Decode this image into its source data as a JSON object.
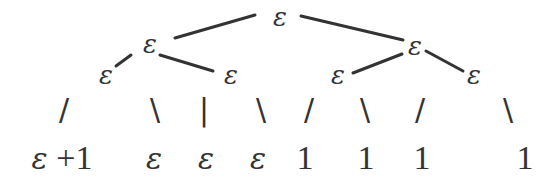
{
  "diagram": {
    "type": "tree",
    "nodes": {
      "root": {
        "label": "ε",
        "x": 280,
        "y": 17
      },
      "l": {
        "label": "ε",
        "x": 150,
        "y": 44
      },
      "r": {
        "label": "ε",
        "x": 415,
        "y": 46
      },
      "ll": {
        "label": "ε",
        "x": 108,
        "y": 74
      },
      "lr": {
        "label": "ε",
        "x": 231,
        "y": 75
      },
      "rl": {
        "label": "ε",
        "x": 338,
        "y": 75
      },
      "rr": {
        "label": "ε",
        "x": 474,
        "y": 75
      }
    },
    "connectors": [
      {
        "glyph": "/",
        "x": 64,
        "y": 110
      },
      {
        "glyph": "\\",
        "x": 155,
        "y": 110
      },
      {
        "glyph": "|",
        "x": 204,
        "y": 110
      },
      {
        "glyph": "\\",
        "x": 261,
        "y": 110
      },
      {
        "glyph": "/",
        "x": 309,
        "y": 110
      },
      {
        "glyph": "\\",
        "x": 365,
        "y": 110
      },
      {
        "glyph": "/",
        "x": 420,
        "y": 110
      },
      {
        "glyph": "\\",
        "x": 508,
        "y": 110
      }
    ],
    "leaves": [
      {
        "eps": "ε",
        "text": " +1",
        "x": 62,
        "y": 158
      },
      {
        "eps": "ε",
        "text": "",
        "x": 154,
        "y": 158
      },
      {
        "eps": "ε",
        "text": "",
        "x": 206,
        "y": 158
      },
      {
        "eps": "ε",
        "text": "",
        "x": 258,
        "y": 158
      },
      {
        "eps": "",
        "text": "1",
        "x": 305,
        "y": 158
      },
      {
        "eps": "",
        "text": "1",
        "x": 366,
        "y": 158
      },
      {
        "eps": "",
        "text": "1",
        "x": 422,
        "y": 158
      },
      {
        "eps": "",
        "text": "1",
        "x": 525,
        "y": 158
      }
    ]
  }
}
